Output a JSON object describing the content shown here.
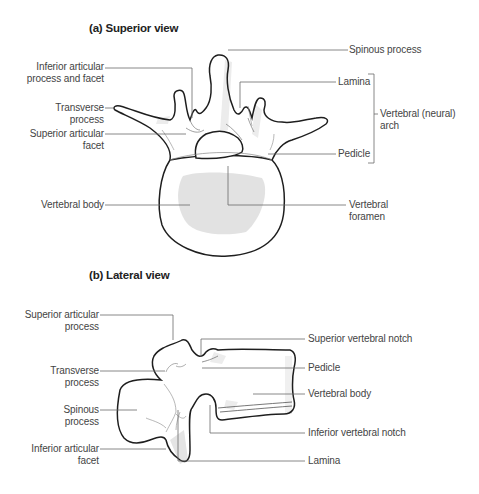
{
  "superior_view": {
    "title": "(a) Superior view",
    "labels": {
      "spinous_process": "Spinous process",
      "inferior_articular_1": "Inferior articular",
      "inferior_articular_2": "process and facet",
      "lamina": "Lamina",
      "transverse_1": "Transverse",
      "transverse_2": "process",
      "superior_articular_1": "Superior articular",
      "superior_articular_2": "facet",
      "vertebral_arch_1": "Vertebral (neural)",
      "vertebral_arch_2": "arch",
      "pedicle": "Pedicle",
      "vertebral_body": "Vertebral body",
      "vertebral_foramen_1": "Vertebral",
      "vertebral_foramen_2": "foramen"
    }
  },
  "lateral_view": {
    "title": "(b) Lateral view",
    "labels": {
      "superior_articular_1": "Superior articular",
      "superior_articular_2": "process",
      "superior_notch": "Superior vertebral notch",
      "transverse_1": "Transverse",
      "transverse_2": "process",
      "pedicle": "Pedicle",
      "spinous_1": "Spinous",
      "spinous_2": "process",
      "vertebral_body": "Vertebral body",
      "inferior_notch": "Inferior vertebral notch",
      "inferior_facet_1": "Inferior articular",
      "inferior_facet_2": "facet",
      "lamina": "Lamina"
    }
  },
  "colors": {
    "outline": "#1e1e1e",
    "leader": "#6a6a6a",
    "shade": "#e4e4e4"
  }
}
